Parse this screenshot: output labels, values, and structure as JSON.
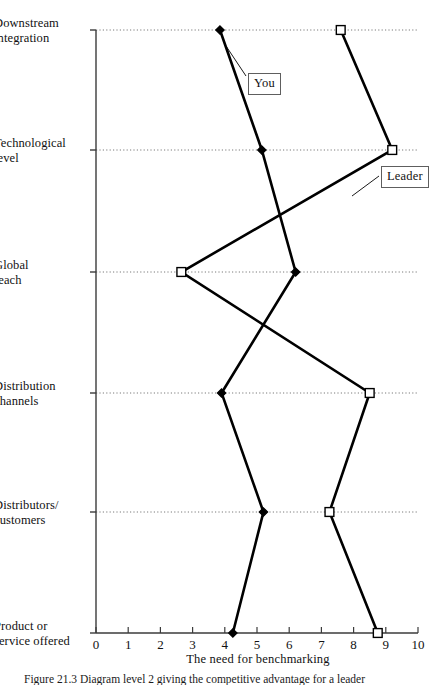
{
  "figure": {
    "caption": "Figure 21.3   Diagram level 2 giving the competitive advantage for a leader"
  },
  "chart_data": {
    "type": "line",
    "orientation": "horizontal",
    "title": "",
    "xlabel": "The need for benchmarking",
    "ylabel": "",
    "xlim": [
      0,
      10
    ],
    "xticks": [
      0,
      1,
      2,
      3,
      4,
      5,
      6,
      7,
      8,
      9,
      10
    ],
    "xticklabels": [
      "0",
      "1",
      "2",
      "3",
      "4",
      "5",
      "6",
      "7",
      "8",
      "9",
      "10"
    ],
    "categories": [
      "Downstream\nintegration",
      "Technological\nlevel",
      "Global\nreach",
      "Distribution\nchannels",
      "Distributors/\ncustomers",
      "Product or\nservice offered"
    ],
    "grid": "horizontal-dotted",
    "legend": "inline-callouts",
    "series": [
      {
        "name": "You",
        "marker": "diamond",
        "marker_fill": "#000000",
        "color": "#000000",
        "values": [
          3.85,
          5.15,
          6.2,
          3.9,
          5.2,
          4.25
        ]
      },
      {
        "name": "Leader",
        "marker": "square",
        "marker_fill": "#ffffff",
        "color": "#000000",
        "values": [
          7.6,
          9.2,
          2.65,
          8.5,
          7.25,
          8.75
        ]
      }
    ],
    "annotations": [
      {
        "text": "You",
        "series": "You"
      },
      {
        "text": "Leader",
        "series": "Leader"
      }
    ]
  },
  "axis": {
    "tick_numbers": [
      "0",
      "1",
      "2",
      "3",
      "4",
      "5",
      "6",
      "7",
      "8",
      "9",
      "10"
    ],
    "x_title": "The need for benchmarking"
  },
  "categories": [
    {
      "line1": "Downstream",
      "line2": "integration"
    },
    {
      "line1": "Technological",
      "line2": "level"
    },
    {
      "line1": "Global",
      "line2": "reach"
    },
    {
      "line1": "Distribution",
      "line2": "channels"
    },
    {
      "line1": "Distributors/",
      "line2": "customers"
    },
    {
      "line1": "Product or",
      "line2": "service offered"
    }
  ],
  "callouts": {
    "you": "You",
    "leader": "Leader"
  },
  "colors": {
    "ink": "#000000",
    "axis": "#3b3b3b",
    "grid": "#7a7a7a",
    "paper": "#ffffff"
  }
}
